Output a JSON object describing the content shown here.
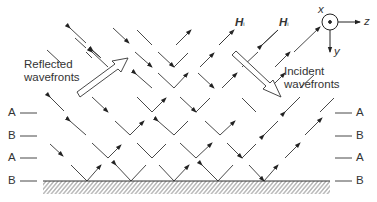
{
  "figure": {
    "labels": {
      "reflected": [
        "Reflected",
        "wavefronts"
      ],
      "incident": [
        "Incident",
        "wavefronts"
      ],
      "h_field_1": "H",
      "h_field_2": "H",
      "h_subscript": "i",
      "axis_x": "x",
      "axis_y": "y",
      "axis_z": "z"
    },
    "layers_left": [
      "A",
      "B",
      "A",
      "B"
    ],
    "layers_right": [
      "A",
      "B",
      "A",
      "B"
    ],
    "colors": {
      "line": "#333333",
      "hatch": "#555555",
      "background": "#ffffff"
    }
  }
}
